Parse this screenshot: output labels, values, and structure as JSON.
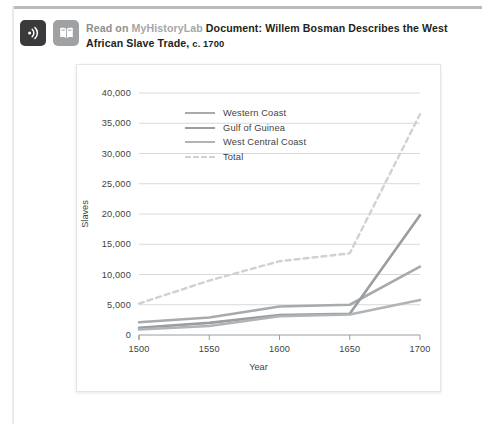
{
  "header": {
    "icons": [
      {
        "name": "audio-listen-icon",
        "glyph": "audio"
      },
      {
        "name": "read-document-icon",
        "glyph": "book"
      }
    ],
    "lede": "Read",
    "lede_on": "on",
    "brand": "MyHistoryLab",
    "doc_label": "Document:",
    "title": "Willem Bosman Describes the West African Slave Trade,",
    "title_tail": "c. 1700"
  },
  "chart_data": {
    "type": "line",
    "title": "",
    "xlabel": "Year",
    "ylabel": "Slaves",
    "x": [
      1500,
      1550,
      1600,
      1650,
      1700
    ],
    "xlim": [
      1500,
      1700
    ],
    "ylim": [
      0,
      40000
    ],
    "xticks": [
      "1500",
      "1550",
      "1600",
      "1650",
      "1700"
    ],
    "yticks": [
      "0",
      "5,000",
      "10,000",
      "15,000",
      "20,000",
      "25,000",
      "30,000",
      "35,000",
      "40,000"
    ],
    "ytick_values": [
      0,
      5000,
      10000,
      15000,
      20000,
      25000,
      30000,
      35000,
      40000
    ],
    "grid": "horizontal",
    "legend_position": "upper-left-inside",
    "series": [
      {
        "name": "Western Coast",
        "color": "#a7abae",
        "style": "solid",
        "values": [
          2100,
          2900,
          4700,
          5000,
          11300
        ]
      },
      {
        "name": "Gulf of Guinea",
        "color": "#9a9ea1",
        "style": "solid",
        "values": [
          1200,
          2000,
          3300,
          3500,
          19800
        ]
      },
      {
        "name": "West Central Coast",
        "color": "#b0b4b7",
        "style": "solid",
        "values": [
          900,
          1500,
          3100,
          3400,
          5800
        ]
      },
      {
        "name": "Total",
        "color": "#cfd2d4",
        "style": "dashed",
        "values": [
          5200,
          9000,
          12200,
          13500,
          36500
        ]
      }
    ]
  }
}
